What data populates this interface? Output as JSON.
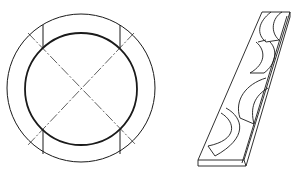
{
  "figure": {
    "background": "#ffffff",
    "stroke_color": "#1a1a1a",
    "ring": {
      "name": "ring-top-view",
      "center": [
        81,
        89
      ],
      "outer_radius": 73,
      "inner_radius": 56,
      "vertical_cut_lines_x": [
        43,
        120
      ],
      "diagonal_centerlines": "dash-dot"
    },
    "strip": {
      "name": "strip-with-arc-cuts",
      "top_face": [
        [
          262,
          12
        ],
        [
          290,
          12
        ],
        [
          244,
          160
        ],
        [
          198,
          160
        ]
      ],
      "thickness_px": 6,
      "arc_segments": 4
    }
  }
}
